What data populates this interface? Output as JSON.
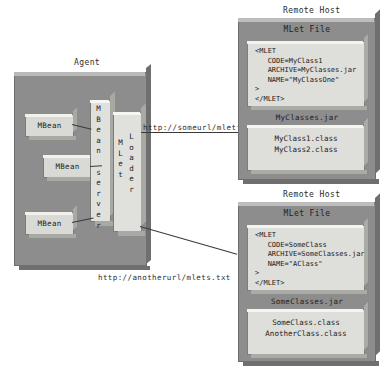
{
  "diagram": {
    "agent": {
      "caption": "Agent",
      "mbeans": [
        {
          "label": "MBean"
        },
        {
          "label": "MBean"
        },
        {
          "label": "MBean"
        }
      ],
      "mbean_server": {
        "label": "MBean server"
      },
      "mlet_loader": {
        "label_top": "MLet",
        "label_bottom": "Loader"
      }
    },
    "connections": [
      {
        "name": "mletfile-url",
        "label": "http://someurl/mletfile"
      },
      {
        "name": "mlets-txt-url",
        "label": "http://anotherurl/mlets.txt"
      }
    ],
    "remote_hosts": [
      {
        "caption": "Remote Host",
        "mlet_file_title": "MLet File",
        "mlet_file_code": "<MLET\n   CODE=MyClass1\n   ARCHIVE=MyClasses.jar\n   NAME=\"MyClassOne\"\n>\n</MLET>",
        "jar_label": "MyClasses.jar",
        "classes": "MyClass1.class\nMyClass2.class"
      },
      {
        "caption": "Remote Host",
        "mlet_file_title": "MLet File",
        "mlet_file_code": "<MLET\n   CODE=SomeClass\n   ARCHIVE=SomeClasses.jar\n   NAME=\"AClass\"\n>\n</MLET>",
        "jar_label": "SomeClasses.jar",
        "classes": "SomeClass.class\nAnotherClass.class"
      }
    ],
    "colors": {
      "container_gray": "#8d8d8d",
      "panel_light": "#dededa",
      "line": "#3a3a3a",
      "text": "#1a1a1a"
    }
  }
}
